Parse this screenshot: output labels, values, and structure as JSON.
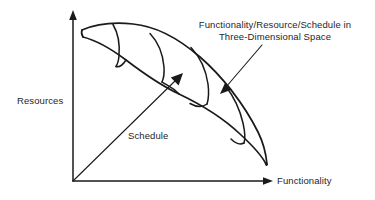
{
  "diagram": {
    "title": "Functionality/Resource/Schedule in Three-Dimensional Space",
    "background_color": "#ffffff",
    "line_color": "#1a1a1a",
    "text_color": "#262626"
  },
  "axes": {
    "y_axis": {
      "label": "Resources",
      "name": "y-axis",
      "orientation": "vertical",
      "arrow": "up"
    },
    "x_axis": {
      "label": "Functionality",
      "name": "x-axis",
      "orientation": "horizontal",
      "arrow": "right"
    },
    "z_axis": {
      "label": "Schedule",
      "name": "z-axis-diagonal",
      "orientation": "diagonal",
      "arrow": "up-right"
    }
  },
  "annotation": {
    "line1": "Functionality/Resource/Schedule in",
    "line2": "Three-Dimensional Space",
    "leader": "arrow pointing into the tube body"
  },
  "shape": {
    "name": "three-dimensional-tradeoff-tube",
    "description": "Curved tube swept from upper-left to lower-right with cross-section ribs",
    "rib_count": 4
  }
}
